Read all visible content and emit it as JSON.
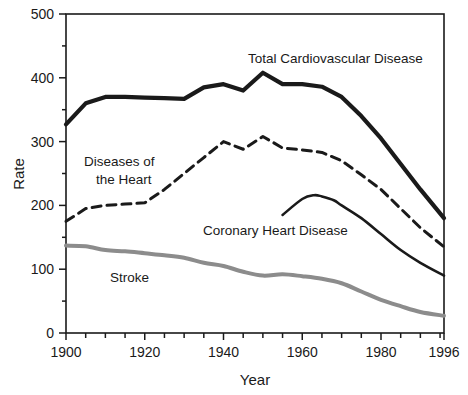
{
  "chart_data": {
    "type": "line",
    "title": "",
    "xlabel": "Year",
    "ylabel": "Rate",
    "xlim": [
      1900,
      1996
    ],
    "ylim": [
      0,
      500
    ],
    "grid": false,
    "legend_position": "inline-annotations",
    "x_ticks_major": [
      1900,
      1920,
      1940,
      1960,
      1980,
      1996
    ],
    "x_tick_labels": [
      "1900",
      "1920",
      "1940",
      "1960",
      "1980",
      "1996"
    ],
    "x_minor_tick_step": 5,
    "y_ticks_major": [
      0,
      100,
      200,
      300,
      400,
      500
    ],
    "y_tick_labels": [
      "0",
      "100",
      "200",
      "300",
      "400",
      "500"
    ],
    "y_minor_tick_step": 50,
    "series": [
      {
        "name": "Total Cardiovascular Disease",
        "style": "solid-thick",
        "color": "#1a1a1a",
        "x": [
          1900,
          1905,
          1910,
          1915,
          1920,
          1925,
          1930,
          1935,
          1940,
          1945,
          1950,
          1955,
          1960,
          1965,
          1970,
          1975,
          1980,
          1985,
          1990,
          1996
        ],
        "values": [
          327,
          360,
          370,
          370,
          369,
          368,
          367,
          385,
          390,
          380,
          408,
          390,
          390,
          386,
          370,
          340,
          305,
          265,
          225,
          180
        ]
      },
      {
        "name": "Diseases of the Heart",
        "style": "dashed",
        "color": "#1a1a1a",
        "x": [
          1900,
          1905,
          1910,
          1915,
          1920,
          1925,
          1930,
          1935,
          1940,
          1945,
          1950,
          1955,
          1960,
          1965,
          1970,
          1975,
          1980,
          1985,
          1990,
          1996
        ],
        "values": [
          175,
          195,
          200,
          202,
          204,
          225,
          250,
          275,
          300,
          288,
          308,
          290,
          287,
          283,
          270,
          248,
          225,
          195,
          165,
          135
        ]
      },
      {
        "name": "Coronary Heart Disease",
        "style": "solid-thin",
        "color": "#1a1a1a",
        "x": [
          1955,
          1960,
          1963,
          1965,
          1968,
          1970,
          1975,
          1980,
          1985,
          1990,
          1996
        ],
        "values": [
          185,
          210,
          216,
          214,
          208,
          200,
          180,
          155,
          130,
          110,
          90
        ]
      },
      {
        "name": "Stroke",
        "style": "solid-gray",
        "color": "#8c8c8c",
        "x": [
          1900,
          1905,
          1910,
          1915,
          1920,
          1925,
          1930,
          1935,
          1940,
          1945,
          1950,
          1955,
          1960,
          1965,
          1970,
          1975,
          1980,
          1985,
          1990,
          1996
        ],
        "values": [
          137,
          136,
          130,
          128,
          125,
          122,
          118,
          110,
          105,
          96,
          90,
          92,
          89,
          85,
          78,
          65,
          52,
          42,
          33,
          27
        ]
      }
    ],
    "annotations": [
      {
        "text": "Total Cardiovascular Disease",
        "x_px": 248,
        "y_px": 63
      },
      {
        "text": "Diseases of",
        "x_px": 84,
        "y_px": 166
      },
      {
        "text": "the Heart",
        "x_px": 96,
        "y_px": 184
      },
      {
        "text": "Coronary Heart Disease",
        "x_px": 203,
        "y_px": 235
      },
      {
        "text": "Stroke",
        "x_px": 110,
        "y_px": 282
      }
    ]
  }
}
